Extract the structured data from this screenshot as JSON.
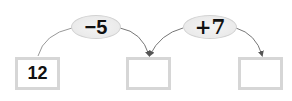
{
  "diagram": {
    "type": "arrow-chain-operations",
    "boxes": [
      {
        "value": "12"
      },
      {
        "value": ""
      },
      {
        "value": ""
      }
    ],
    "operations": [
      {
        "label": "−5"
      },
      {
        "label": "+7"
      }
    ],
    "colors": {
      "box_border": "#d6d6d6",
      "oval_fill": "#ececec",
      "line": "#888888",
      "text": "#111111"
    }
  }
}
